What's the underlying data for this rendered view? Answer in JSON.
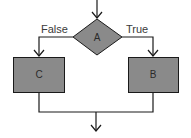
{
  "diagram": {
    "type": "flowchart",
    "colors": {
      "node_fill": "#8a8a8a",
      "stroke": "#1a1a1a",
      "background": "#ffffff",
      "text": "#3a3a3a"
    },
    "decision": {
      "id": "A",
      "label": "A"
    },
    "nodes": [
      {
        "id": "C",
        "label": "C"
      },
      {
        "id": "B",
        "label": "B"
      }
    ],
    "edges": [
      {
        "from": "entry",
        "to": "A",
        "label": ""
      },
      {
        "from": "A",
        "to": "C",
        "label": "False"
      },
      {
        "from": "A",
        "to": "B",
        "label": "True"
      },
      {
        "from": "C",
        "to": "exit",
        "label": ""
      },
      {
        "from": "B",
        "to": "exit",
        "label": ""
      }
    ]
  }
}
